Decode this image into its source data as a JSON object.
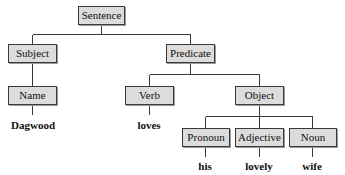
{
  "diagram": {
    "type": "parse-tree",
    "colors": {
      "node_fill": "#dcdcdc",
      "node_border": "#3a3a3a",
      "line": "#3a3a3a",
      "text": "#111111"
    },
    "nodes": {
      "sentence": "Sentence",
      "subject": "Subject",
      "predicate": "Predicate",
      "name": "Name",
      "verb": "Verb",
      "object": "Object",
      "pronoun": "Pronoun",
      "adjective": "Adjective",
      "noun": "Noun"
    },
    "leaves": {
      "dagwood": "Dagwood",
      "loves": "loves",
      "his": "his",
      "lovely": "lovely",
      "wife": "wife"
    },
    "edges": [
      [
        "Sentence",
        "Subject"
      ],
      [
        "Sentence",
        "Predicate"
      ],
      [
        "Subject",
        "Name"
      ],
      [
        "Name",
        "Dagwood"
      ],
      [
        "Predicate",
        "Verb"
      ],
      [
        "Predicate",
        "Object"
      ],
      [
        "Verb",
        "loves"
      ],
      [
        "Object",
        "Pronoun"
      ],
      [
        "Object",
        "Adjective"
      ],
      [
        "Object",
        "Noun"
      ],
      [
        "Pronoun",
        "his"
      ],
      [
        "Adjective",
        "lovely"
      ],
      [
        "Noun",
        "wife"
      ]
    ]
  }
}
